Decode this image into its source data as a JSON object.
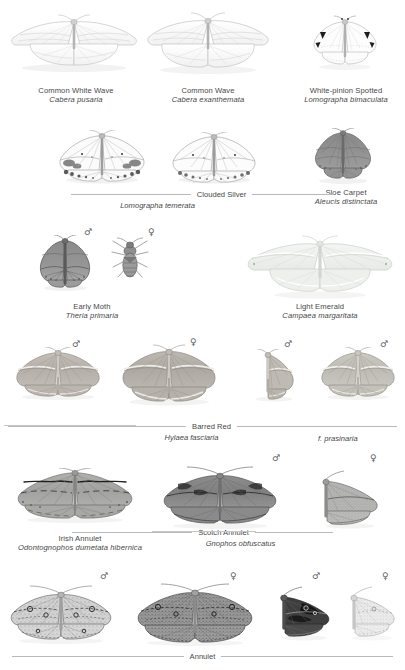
{
  "plate": {
    "title": "Geometridae plate — Ennominae / Sterrhinae",
    "background": "#ffffff",
    "ink": "#474747",
    "rule_color": "#b9b9b9",
    "symbols": {
      "male": "♂",
      "female": "♀"
    }
  },
  "rows": [
    {
      "id": "row-1",
      "entries": [
        {
          "common": "Common White Wave",
          "scientific": "Cabera pusaria",
          "style": "plain",
          "wing_tone": "#fcfcfc",
          "vein_tone": "#c9c9c9"
        },
        {
          "common": "Common Wave",
          "scientific": "Cabera exanthemata",
          "style": "plain",
          "wing_tone": "#fbfbfb",
          "vein_tone": "#c9c9c9"
        },
        {
          "common": "White-pinion Spotted",
          "scientific": "Lomographa bimaculata",
          "style": "plain",
          "wing_tone": "#fdfdfd",
          "vein_tone": "#bfbfbf"
        }
      ]
    },
    {
      "id": "row-2",
      "entries": [
        {
          "common": "Clouded Silver",
          "scientific": "Lomographa temerata",
          "style": "ruled",
          "wing_tone": "#fafafa",
          "vein_tone": "#9a9a9a"
        },
        {
          "common": "Sloe Carpet",
          "scientific": "Aleucis distinctata",
          "style": "plain",
          "wing_tone": "#8c8c8c",
          "vein_tone": "#5a5a5a"
        }
      ]
    },
    {
      "id": "row-3",
      "entries": [
        {
          "common": "Early Moth",
          "scientific": "Theria primaria",
          "style": "plain",
          "sexes": [
            "♂",
            "♀"
          ],
          "wing_tone": "#8f8f8f",
          "vein_tone": "#525252"
        },
        {
          "common": "Light Emerald",
          "scientific": "Campaea margaritata",
          "style": "plain",
          "wing_tone": "#eef0ec",
          "vein_tone": "#cfd3ce"
        }
      ]
    },
    {
      "id": "row-4",
      "entries": [
        {
          "common": "Barred Red",
          "scientific": "Hylaea fasciaria",
          "style": "ruled",
          "sexes": [
            "♂",
            "♀",
            "♂"
          ],
          "wing_tone": "#b9b4ae",
          "vein_tone": "#8e8881"
        },
        {
          "common": "",
          "scientific": "f. prasinaria",
          "style": "form",
          "sexes": [
            "♂"
          ],
          "wing_tone": "#c4c2bb",
          "vein_tone": "#97948c"
        }
      ]
    },
    {
      "id": "row-5",
      "entries": [
        {
          "common": "Irish Annulet",
          "scientific": "Odontognophos dumetata hibernica",
          "style": "plain",
          "wing_tone": "#a8a8a6",
          "vein_tone": "#6d6d6b"
        },
        {
          "common": "Scotch Annulet",
          "scientific": "Gnophos obfuscatus",
          "style": "ruled",
          "sexes": [
            "♂",
            "♀"
          ],
          "wing_tone": "#909090",
          "vein_tone": "#565656"
        }
      ]
    },
    {
      "id": "row-6",
      "entries": [
        {
          "common": "Annulet",
          "scientific": "",
          "style": "ruled",
          "sexes": [
            "♂",
            "♀",
            "♂",
            "♀"
          ],
          "wing_tone": "#bdbdbd",
          "vein_tone": "#6a6a6a"
        }
      ]
    }
  ],
  "specimens": [
    {
      "id": "cabera-pusaria",
      "name": "Common White Wave",
      "sex": "",
      "x": 8,
      "y": 12,
      "w": 132,
      "h": 62
    },
    {
      "id": "cabera-exanthemata",
      "name": "Common Wave",
      "sex": "",
      "x": 144,
      "y": 10,
      "w": 128,
      "h": 66
    },
    {
      "id": "lomographa-bimaculata",
      "name": "White-pinion Spotted",
      "sex": "",
      "x": 308,
      "y": 14,
      "w": 74,
      "h": 58
    },
    {
      "id": "clouded-silver-a",
      "name": "Clouded Silver left",
      "sex": "",
      "x": 56,
      "y": 130,
      "w": 92,
      "h": 56
    },
    {
      "id": "clouded-silver-b",
      "name": "Clouded Silver right",
      "sex": "",
      "x": 168,
      "y": 132,
      "w": 92,
      "h": 54
    },
    {
      "id": "aleucis-distinctata",
      "name": "Sloe Carpet",
      "sex": "",
      "x": 310,
      "y": 128,
      "w": 66,
      "h": 58
    },
    {
      "id": "theria-primaria-m",
      "name": "Early Moth male",
      "sex": "♂",
      "x": 36,
      "y": 235,
      "w": 58,
      "h": 58
    },
    {
      "id": "theria-primaria-f",
      "name": "Early Moth female",
      "sex": "♀",
      "x": 110,
      "y": 237,
      "w": 40,
      "h": 48
    },
    {
      "id": "campaea-margaritata",
      "name": "Light Emerald",
      "sex": "",
      "x": 244,
      "y": 233,
      "w": 152,
      "h": 68
    },
    {
      "id": "hylaea-fasciaria-m",
      "name": "Barred Red male",
      "sex": "♂",
      "x": 12,
      "y": 347,
      "w": 92,
      "h": 56
    },
    {
      "id": "hylaea-fasciaria-f",
      "name": "Barred Red female",
      "sex": "♀",
      "x": 118,
      "y": 344,
      "w": 102,
      "h": 64
    },
    {
      "id": "hylaea-fasciaria-m2",
      "name": "Barred Red male 2",
      "sex": "♂",
      "x": 248,
      "y": 349,
      "w": 48,
      "h": 56
    },
    {
      "id": "hylaea-prasinaria-m",
      "name": "f. prasinaria male",
      "sex": "♂",
      "x": 318,
      "y": 347,
      "w": 80,
      "h": 56
    },
    {
      "id": "odontognophos",
      "name": "Irish Annulet",
      "sex": "",
      "x": 14,
      "y": 468,
      "w": 122,
      "h": 58
    },
    {
      "id": "gnophos-obfuscatus-m",
      "name": "Scotch Annulet male",
      "sex": "♂",
      "x": 160,
      "y": 466,
      "w": 120,
      "h": 66
    },
    {
      "id": "gnophos-obfuscatus-f",
      "name": "Scotch Annulet female",
      "sex": "♀",
      "x": 312,
      "y": 470,
      "w": 72,
      "h": 62
    },
    {
      "id": "annulet-m1",
      "name": "Annulet male",
      "sex": "♂",
      "x": 8,
      "y": 585,
      "w": 106,
      "h": 62
    },
    {
      "id": "annulet-f1",
      "name": "Annulet female",
      "sex": "♀",
      "x": 134,
      "y": 583,
      "w": 122,
      "h": 66
    },
    {
      "id": "annulet-m2",
      "name": "Annulet male dark",
      "sex": "♂",
      "x": 272,
      "y": 586,
      "w": 62,
      "h": 58
    },
    {
      "id": "annulet-f2",
      "name": "Annulet female pale",
      "sex": "♀",
      "x": 344,
      "y": 586,
      "w": 54,
      "h": 58
    }
  ],
  "sex_marks": [
    {
      "id": "mark-early-m",
      "symbol": "♂",
      "x": 84,
      "y": 228
    },
    {
      "id": "mark-early-f",
      "symbol": "♀",
      "x": 148,
      "y": 228
    },
    {
      "id": "mark-barred-m",
      "symbol": "♂",
      "x": 72,
      "y": 340
    },
    {
      "id": "mark-barred-f",
      "symbol": "♀",
      "x": 190,
      "y": 338
    },
    {
      "id": "mark-barred-m2",
      "symbol": "♂",
      "x": 284,
      "y": 340
    },
    {
      "id": "mark-pras-m",
      "symbol": "♂",
      "x": 380,
      "y": 340
    },
    {
      "id": "mark-scotch-m",
      "symbol": "♂",
      "x": 272,
      "y": 454
    },
    {
      "id": "mark-scotch-f",
      "symbol": "♀",
      "x": 370,
      "y": 454
    },
    {
      "id": "mark-ann-m1",
      "symbol": "♂",
      "x": 100,
      "y": 572
    },
    {
      "id": "mark-ann-f1",
      "symbol": "♀",
      "x": 230,
      "y": 572
    },
    {
      "id": "mark-ann-m2",
      "symbol": "♂",
      "x": 312,
      "y": 572
    },
    {
      "id": "mark-ann-f2",
      "symbol": "♀",
      "x": 382,
      "y": 572
    }
  ],
  "captions": {
    "c1": {
      "common": "Common White Wave",
      "sci": "Cabera pusaria",
      "x": 6,
      "y": 86,
      "w": 140
    },
    "c2": {
      "common": "Common Wave",
      "sci": "Cabera exanthemata",
      "x": 140,
      "y": 86,
      "w": 136
    },
    "c3": {
      "common": "White-pinion Spotted",
      "sci": "Lomographa bimaculata",
      "x": 288,
      "y": 86,
      "w": 116
    },
    "c4": {
      "common": "Sloe Carpet",
      "sci": "Aleucis distinctata",
      "x": 300,
      "y": 188,
      "w": 92
    },
    "c5": {
      "common": "Early Moth",
      "sci": "Theria primaria",
      "x": 46,
      "y": 302,
      "w": 92
    },
    "c6": {
      "common": "Light Emerald",
      "sci": "Campaea margaritata",
      "x": 256,
      "y": 302,
      "w": 128
    },
    "c7": {
      "common": "Irish Annulet",
      "sci": "Odontognophos dumetata hibernica",
      "x": 4,
      "y": 534,
      "w": 152
    }
  },
  "ruled_captions": {
    "clouded_silver": {
      "common": "Clouded Silver",
      "sci": "Lomographa temerata",
      "y": 190,
      "left_rule": 120,
      "right_rule": 82,
      "center": 157
    },
    "barred_red": {
      "common": "Barred Red",
      "sci": "Hylaea fasciaria",
      "form": "f. prasinaria",
      "y": 422,
      "left_rule": 178,
      "right_rule": 160,
      "center": 206,
      "form_x": 320
    },
    "scotch_annulet": {
      "common": "Scotch Annulet",
      "sci": "Gnophos obfuscatus",
      "y": 528,
      "left_rule": 120,
      "right_rule": 78,
      "center": 283
    },
    "annulet": {
      "common": "Annulet",
      "sci": "",
      "y": 656,
      "left_rule": 172,
      "right_rule": 172,
      "center": 203
    }
  },
  "separators": [
    {
      "id": "sep-barred-red-left",
      "x": 4,
      "y": 422,
      "w": 136
    },
    {
      "id": "sep-scotch-left",
      "x": 152,
      "y": 528,
      "w": 106
    },
    {
      "id": "sep-annulet-left",
      "x": 4,
      "y": 656,
      "w": 172
    },
    {
      "id": "sep-annulet-right",
      "x": 228,
      "y": 656,
      "w": 172
    }
  ]
}
